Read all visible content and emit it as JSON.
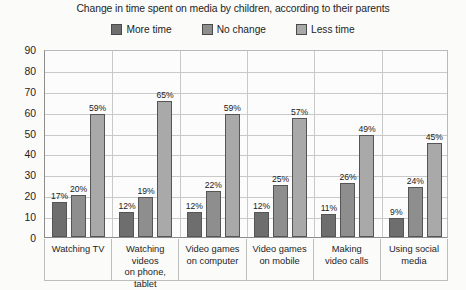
{
  "chart_data": {
    "type": "bar",
    "title": "Change in time spent on media by children, according to their parents",
    "xlabel": "",
    "ylabel": "",
    "ylim": [
      0,
      90
    ],
    "ytick_step": 10,
    "yticks": [
      "0",
      "10",
      "20",
      "30",
      "40",
      "50",
      "60",
      "70",
      "80",
      "90"
    ],
    "grid": true,
    "legend_position": "top-center",
    "value_suffix": "%",
    "categories": [
      "Watching TV",
      "Watching videos on phone, tablet",
      "Video games on computer",
      "Video games on mobile",
      "Making video calls",
      "Using social media"
    ],
    "category_lines": [
      [
        "Watching TV"
      ],
      [
        "Watching videos",
        "on phone, tablet"
      ],
      [
        "Video games",
        "on computer"
      ],
      [
        "Video games",
        "on mobile"
      ],
      [
        "Making",
        "video calls"
      ],
      [
        "Using social",
        "media"
      ]
    ],
    "series": [
      {
        "name": "More time",
        "color": "#6e6e6e",
        "values": [
          17,
          12,
          12,
          12,
          11,
          9
        ],
        "labels": [
          "17%",
          "12%",
          "12%",
          "12%",
          "11%",
          "9%"
        ]
      },
      {
        "name": "No change",
        "color": "#8e8e8e",
        "values": [
          20,
          19,
          22,
          25,
          26,
          24
        ],
        "labels": [
          "20%",
          "19%",
          "22%",
          "25%",
          "26%",
          "24%"
        ]
      },
      {
        "name": "Less time",
        "color": "#a9a9a9",
        "values": [
          59,
          65,
          59,
          57,
          49,
          45
        ],
        "labels": [
          "59%",
          "65%",
          "59%",
          "57%",
          "49%",
          "45%"
        ]
      }
    ]
  },
  "colors": {
    "background": "#fbfbfa",
    "plot_background": "#fcfcfc",
    "gridline": "#c9c9c9",
    "axis": "#8d8d8d",
    "text": "#1e1e1e",
    "bar_outline": "#555555"
  }
}
